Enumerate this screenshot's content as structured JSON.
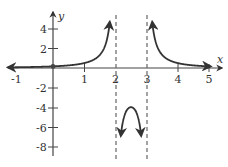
{
  "chart_data": {
    "type": "line",
    "title": "",
    "xlabel": "x",
    "ylabel": "y",
    "xlim": [
      -1,
      5
    ],
    "ylim": [
      -8,
      5
    ],
    "grid": false,
    "legend": null,
    "x_ticks": [
      "-1",
      "1",
      "2",
      "3",
      "4",
      "5"
    ],
    "y_ticks": [
      "4",
      "2",
      "-2",
      "-4",
      "-6",
      "-8"
    ],
    "function": "y = 1/((x-2)(x-3))",
    "vertical_asymptotes": [
      2,
      3
    ],
    "horizontal_asymptote": 0,
    "series": [
      {
        "name": "left branch",
        "x": [
          -1,
          0,
          1,
          1.5,
          1.8,
          1.9
        ],
        "y": [
          0.083,
          0.167,
          0.5,
          1.33,
          4.17,
          9.09
        ]
      },
      {
        "name": "middle branch",
        "x": [
          2.1,
          2.2,
          2.5,
          2.8,
          2.9
        ],
        "y": [
          -11.1,
          -6.25,
          -4,
          -6.25,
          -11.1
        ]
      },
      {
        "name": "right branch",
        "x": [
          3.1,
          3.2,
          3.5,
          4,
          5
        ],
        "y": [
          9.09,
          4.17,
          1.33,
          0.5,
          0.167
        ]
      }
    ],
    "points": [
      {
        "x": 0,
        "y": 0.167,
        "label": "y-intercept"
      }
    ]
  }
}
